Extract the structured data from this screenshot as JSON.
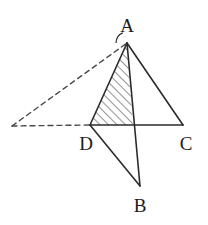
{
  "figure": {
    "type": "geometry-diagram",
    "canvas": {
      "width": 208,
      "height": 225,
      "background": "#ffffff"
    },
    "style": {
      "stroke_color": "#2b2b2b",
      "stroke_width": 1.6,
      "dash_color": "#4a4a4a",
      "dash_pattern": "5 4",
      "hatch_color": "#3a3a3a",
      "hatch_width": 1.1,
      "hatch_angle_deg": 45,
      "hatch_spacing": 6,
      "label_color": "#1c1c1c",
      "label_font_size": 19
    },
    "points": {
      "A": {
        "label": "A",
        "x": 127,
        "y": 43,
        "label_x": 127,
        "label_y": 25
      },
      "B": {
        "label": "B",
        "x": 140,
        "y": 186,
        "label_x": 140,
        "label_y": 205
      },
      "C": {
        "label": "C",
        "x": 183,
        "y": 125,
        "label_x": 186,
        "label_y": 143
      },
      "D": {
        "label": "D",
        "x": 90,
        "y": 125,
        "label_x": 86,
        "label_y": 143
      },
      "E": {
        "label": "",
        "x": 12,
        "y": 126,
        "label_x": 12,
        "label_y": 126
      },
      "M": {
        "label": "",
        "x": 133,
        "y": 125,
        "label_x": 133,
        "label_y": 125
      }
    },
    "solid_segments": [
      {
        "name": "segment-A-D",
        "from": "A",
        "to": "D"
      },
      {
        "name": "segment-A-C",
        "from": "A",
        "to": "C"
      },
      {
        "name": "segment-D-C",
        "from": "D",
        "to": "C"
      },
      {
        "name": "segment-A-B",
        "from": "A",
        "to": "B"
      },
      {
        "name": "segment-D-B",
        "from": "D",
        "to": "B"
      }
    ],
    "dashed_segments": [
      {
        "name": "dashed-segment-E-A",
        "from": "E",
        "to": "A"
      },
      {
        "name": "dashed-segment-E-D",
        "from": "E",
        "to": "D"
      }
    ],
    "hatched_region": {
      "name": "hatched-triangle-A-D-M",
      "vertices": [
        "A",
        "D",
        "M"
      ]
    },
    "angle_marks": [
      {
        "name": "angle-mark-at-A",
        "at": "A",
        "radius": 11,
        "start_deg": 180,
        "end_deg": 247
      }
    ],
    "labels": [
      "A",
      "B",
      "C",
      "D"
    ]
  }
}
